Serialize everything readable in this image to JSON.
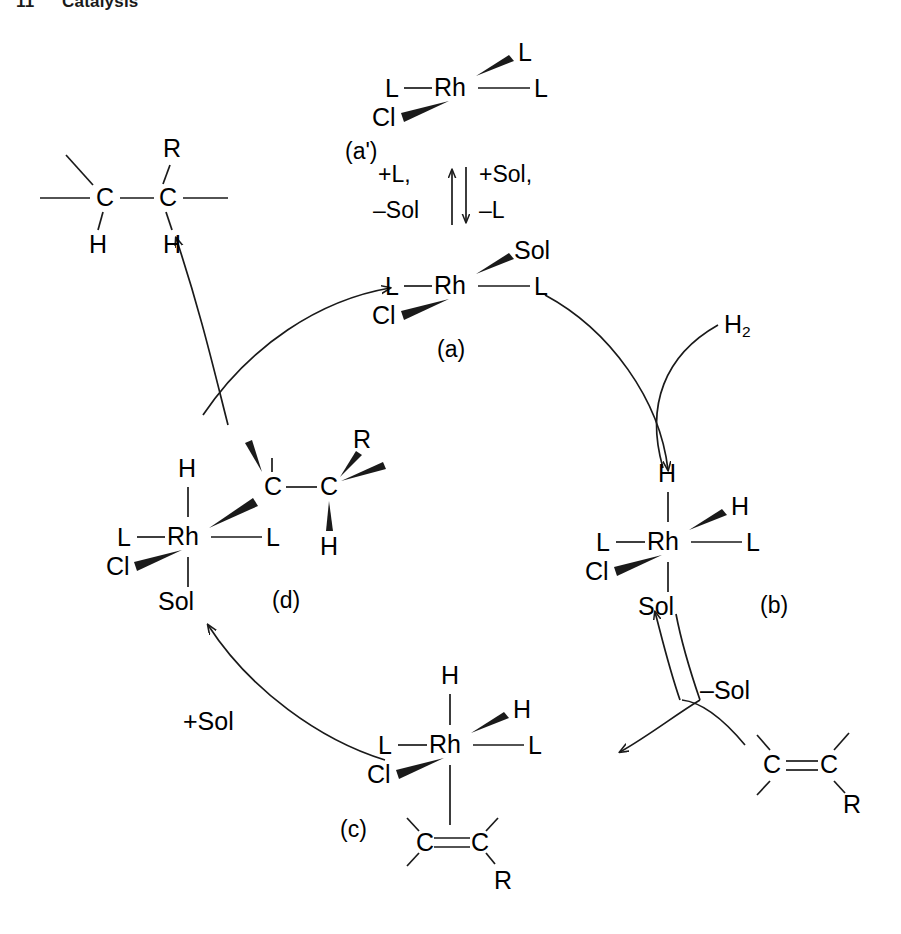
{
  "header": {
    "chapter_number": "11",
    "chapter_title": "Catalysis"
  },
  "diagram": {
    "type": "catalytic-cycle",
    "structures": [
      {
        "id": "a-prime",
        "tag": "(a')",
        "center_atom": "Rh",
        "ligands": {
          "left": "L",
          "right": "L",
          "wedge_upper_right": "L",
          "wedge_lower_left": "Cl"
        }
      },
      {
        "id": "a",
        "tag": "(a)",
        "center_atom": "Rh",
        "ligands": {
          "left": "L",
          "right": "L",
          "wedge_upper_right": "Sol",
          "wedge_lower_left": "Cl"
        }
      },
      {
        "id": "b",
        "tag": "(b)",
        "center_atom": "Rh",
        "ligands": {
          "top": "H",
          "wedge_upper_right": "H",
          "left": "L",
          "right": "L",
          "wedge_lower_left": "Cl",
          "bottom": "Sol"
        }
      },
      {
        "id": "c",
        "tag": "(c)",
        "center_atom": "Rh",
        "ligands": {
          "top": "H",
          "wedge_upper_right": "H",
          "left": "L",
          "right": "L",
          "wedge_lower_left": "Cl",
          "bottom_alkene_left": "C",
          "bottom_alkene_right": "C",
          "bottom_alkene_substituent": "R"
        }
      },
      {
        "id": "d",
        "tag": "(d)",
        "center_atom": "Rh",
        "ligands": {
          "top": "H",
          "left": "L",
          "right": "L",
          "wedge_lower_left": "Cl",
          "bottom": "Sol",
          "alkyl_c1": "C",
          "alkyl_c2": "C",
          "alkyl_substituent": "R",
          "alkyl_hydrogen": "H"
        }
      },
      {
        "id": "product",
        "tag": "",
        "atoms": {
          "c1": "C",
          "c2": "C",
          "h1": "H",
          "h2": "H",
          "r": "R"
        }
      },
      {
        "id": "substrate-alkene",
        "tag": "",
        "atoms": {
          "c1": "C",
          "c2": "C",
          "r": "R"
        }
      }
    ],
    "reagents": {
      "hydrogen": "H2",
      "hydrogen_base": "H",
      "hydrogen_sub": "2",
      "minus_sol": "–Sol",
      "plus_sol": "+Sol"
    },
    "equilibrium": {
      "left_top": "+L,",
      "left_bottom": "–Sol",
      "right_top": "+Sol,",
      "right_bottom": "–L"
    },
    "atom_labels": {
      "Rh": "Rh",
      "Cl": "Cl",
      "L": "L",
      "H": "H",
      "C": "C",
      "R": "R",
      "Sol": "Sol"
    },
    "colors": {
      "stroke": "#1a1a1a",
      "text": "#000000",
      "background": "#ffffff"
    }
  }
}
